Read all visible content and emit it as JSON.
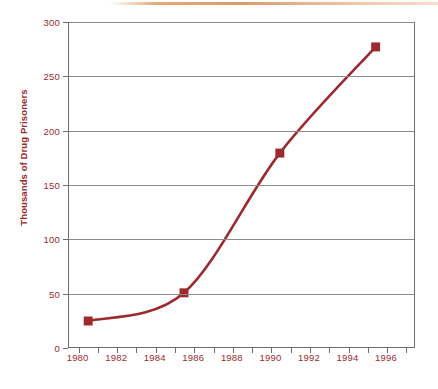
{
  "decor": {
    "top_rule_color": "#d99a6c"
  },
  "chart_data": {
    "type": "line",
    "title": "",
    "xlabel": "",
    "ylabel": "Thousands of Drug Prisoners",
    "xlim": [
      1979.5,
      1997.5
    ],
    "ylim": [
      0,
      300
    ],
    "grid": true,
    "legend": "none",
    "series_color": "#9c2a2f",
    "marker": "square",
    "x": [
      1980.5,
      1985.5,
      1990.5,
      1995.5
    ],
    "values": [
      24,
      50,
      179,
      277
    ],
    "points": [
      {
        "x": 1980.5,
        "y": 24
      },
      {
        "x": 1985.5,
        "y": 50
      },
      {
        "x": 1990.5,
        "y": 179
      },
      {
        "x": 1995.5,
        "y": 277
      }
    ],
    "yticks": [
      0,
      50,
      100,
      150,
      200,
      250,
      300
    ],
    "ytick_labels": [
      "0",
      "50",
      "100",
      "150",
      "200",
      "250",
      "300"
    ],
    "xticks": [
      1980,
      1981,
      1982,
      1983,
      1984,
      1985,
      1986,
      1987,
      1988,
      1989,
      1990,
      1991,
      1992,
      1993,
      1994,
      1995,
      1996,
      1997
    ],
    "xtick_labels": [
      {
        "value": 1980,
        "label": "1980"
      },
      {
        "value": 1982,
        "label": "1982"
      },
      {
        "value": 1984,
        "label": "1984"
      },
      {
        "value": 1986,
        "label": "1986"
      },
      {
        "value": 1988,
        "label": "1988"
      },
      {
        "value": 1990,
        "label": "1990"
      },
      {
        "value": 1992,
        "label": "1992"
      },
      {
        "value": 1994,
        "label": "1994"
      },
      {
        "value": 1996,
        "label": "1996"
      }
    ]
  }
}
